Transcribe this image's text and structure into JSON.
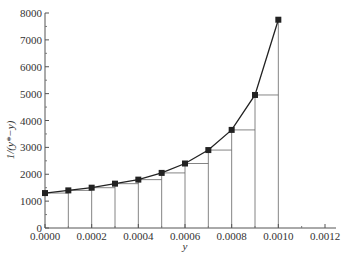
{
  "chart_data": {
    "type": "line",
    "title": "",
    "xlabel": "y",
    "ylabel": "1/(y*−y)",
    "xlim": [
      0,
      0.0012
    ],
    "ylim": [
      0,
      8000
    ],
    "x_ticks": [
      "0.0000",
      "0.0002",
      "0.0004",
      "0.0006",
      "0.0008",
      "0.0010",
      "0.0012"
    ],
    "y_ticks": [
      "0",
      "1000",
      "2000",
      "3000",
      "4000",
      "5000",
      "6000",
      "7000",
      "8000"
    ],
    "grid": false,
    "legend": null,
    "x": [
      0.0,
      0.0001,
      0.0002,
      0.0003,
      0.0004,
      0.0005,
      0.0006,
      0.0007,
      0.0008,
      0.0009,
      0.001
    ],
    "series": [
      {
        "name": "1/(y*−y)",
        "marker": "square",
        "values": [
          1300,
          1400,
          1500,
          1650,
          1800,
          2050,
          2400,
          2900,
          3650,
          4950,
          7750
        ]
      }
    ],
    "annotations": "Left-endpoint rectangles drawn under the curve for each interval of width 0.0001"
  }
}
